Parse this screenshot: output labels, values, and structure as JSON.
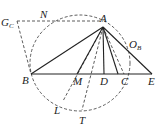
{
  "diagram": {
    "type": "geometry-figure",
    "points": {
      "A": {
        "label": "A",
        "x": 103,
        "y": 27
      },
      "B": {
        "label": "B",
        "x": 31,
        "y": 74
      },
      "M": {
        "label": "M",
        "x": 77,
        "y": 74
      },
      "D": {
        "label": "D",
        "x": 104,
        "y": 74
      },
      "C": {
        "label": "C",
        "x": 124,
        "y": 74
      },
      "E": {
        "label": "E",
        "x": 152,
        "y": 74
      },
      "GC": {
        "label": "G",
        "sub": "C",
        "x": 15,
        "y": 20
      },
      "N": {
        "label": "N",
        "x": 43,
        "y": 20
      },
      "OB": {
        "label": "O",
        "sub": "B",
        "x": 130,
        "y": 45
      },
      "L": {
        "label": "L",
        "x": 63,
        "y": 101
      },
      "T": {
        "label": "T",
        "x": 82,
        "y": 110
      }
    },
    "solid_segments": [
      "AB",
      "AM",
      "AD",
      "AC",
      "AE",
      "BE"
    ],
    "dashed_segments": [
      "GC-A",
      "GC-B",
      "AL",
      "AT",
      "A-C(dashed)"
    ],
    "circle": {
      "style": "dashed",
      "through": [
        "B",
        "N",
        "A",
        "C",
        "T",
        "L"
      ]
    }
  }
}
